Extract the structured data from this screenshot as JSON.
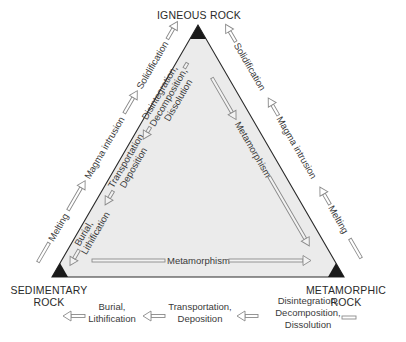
{
  "diagram": {
    "colors": {
      "triangle_fill": "#ebebeb",
      "triangle_edge": "#2a2a2a",
      "vertex_marker": "#1a1a1a",
      "arrow_stroke": "#8a8a8a",
      "text": "#3a3a3a"
    },
    "vertices": {
      "igneous": {
        "label": "IGNEOUS ROCK"
      },
      "sedimentary": {
        "label_line1": "SEDIMENTARY",
        "label_line2": "ROCK"
      },
      "metamorphic": {
        "label_line1": "METAMORPHIC",
        "label_line2": "ROCK"
      }
    },
    "outer_left_side": {
      "direction": "sedimentary-to-igneous",
      "steps": [
        "Melting",
        "Magma intrusion",
        "Solidification"
      ]
    },
    "outer_right_side": {
      "direction": "metamorphic-to-igneous",
      "steps": [
        "Melting",
        "Magma intrusion",
        "Solidification"
      ]
    },
    "inner_left_side": {
      "direction": "igneous-to-sedimentary",
      "steps": [
        {
          "line1": "Disintegration,",
          "line2": "Decomposition,",
          "line3": "Dissolution"
        },
        {
          "line1": "Transportation,",
          "line2": "Deposition"
        },
        {
          "line1": "Burial,",
          "line2": "Lithification"
        }
      ]
    },
    "inner_right_side": {
      "direction": "igneous-to-metamorphic",
      "label": "Metamorphism"
    },
    "inner_bottom_side": {
      "direction": "sedimentary-to-metamorphic",
      "label": "Metamorphism"
    },
    "outer_bottom": {
      "direction": "metamorphic-to-sedimentary",
      "steps": [
        {
          "line1": "Disintegration,",
          "line2": "Decomposition,",
          "line3": "Dissolution"
        },
        {
          "line1": "Transportation,",
          "line2": "Deposition"
        },
        {
          "line1": "Burial,",
          "line2": "Lithification"
        }
      ]
    }
  }
}
